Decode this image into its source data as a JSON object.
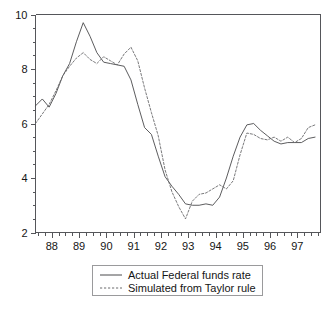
{
  "chart_data": {
    "type": "line",
    "title": "",
    "subtitle": "",
    "xlabel": "",
    "ylabel": "",
    "xlim": [
      1987.4,
      1997.85
    ],
    "ylim": [
      2,
      10
    ],
    "grid": false,
    "legend_position": "below-center",
    "y_ticks": [
      "10",
      "8",
      "6",
      "4",
      "2"
    ],
    "y_tick_values": [
      10,
      8,
      6,
      4,
      2
    ],
    "y_minor_step": 0.5,
    "x_ticks": [
      "88",
      "89",
      "90",
      "91",
      "92",
      "93",
      "94",
      "95",
      "96",
      "97"
    ],
    "x_tick_values": [
      1988,
      1989,
      1990,
      1991,
      1992,
      1993,
      1994,
      1995,
      1996,
      1997
    ],
    "x_minor_step": 0.25,
    "series": [
      {
        "name": "Actual Federal funds rate",
        "style": "solid",
        "color": "#4a4a4c",
        "x": [
          1987.4,
          1987.65,
          1987.9,
          1988.15,
          1988.4,
          1988.65,
          1988.9,
          1989.15,
          1989.4,
          1989.65,
          1989.9,
          1990.15,
          1990.4,
          1990.65,
          1990.9,
          1991.15,
          1991.4,
          1991.65,
          1991.9,
          1992.15,
          1992.4,
          1992.65,
          1992.9,
          1993.15,
          1993.4,
          1993.65,
          1993.9,
          1994.15,
          1994.4,
          1994.65,
          1994.9,
          1995.15,
          1995.4,
          1995.65,
          1995.9,
          1996.15,
          1996.4,
          1996.65,
          1996.9,
          1997.15,
          1997.4,
          1997.65
        ],
        "y": [
          6.65,
          6.9,
          6.6,
          7.1,
          7.75,
          8.2,
          9.0,
          9.7,
          9.2,
          8.6,
          8.25,
          8.2,
          8.15,
          8.1,
          7.6,
          6.7,
          5.85,
          5.6,
          4.8,
          4.05,
          3.7,
          3.4,
          3.05,
          3.0,
          3.0,
          3.05,
          3.0,
          3.3,
          4.0,
          4.8,
          5.5,
          5.95,
          6.0,
          5.75,
          5.55,
          5.35,
          5.25,
          5.3,
          5.3,
          5.3,
          5.45,
          5.5
        ]
      },
      {
        "name": "Simulated from Taylor rule",
        "style": "dotted",
        "color": "#6a6a6c",
        "x": [
          1987.4,
          1987.65,
          1987.9,
          1988.15,
          1988.4,
          1988.65,
          1988.9,
          1989.15,
          1989.4,
          1989.65,
          1989.9,
          1990.15,
          1990.4,
          1990.65,
          1990.9,
          1991.15,
          1991.4,
          1991.65,
          1991.9,
          1992.15,
          1992.4,
          1992.65,
          1992.9,
          1993.15,
          1993.4,
          1993.65,
          1993.9,
          1994.15,
          1994.4,
          1994.65,
          1994.9,
          1995.15,
          1995.4,
          1995.65,
          1995.9,
          1996.15,
          1996.4,
          1996.65,
          1996.9,
          1997.15,
          1997.4,
          1997.65
        ],
        "y": [
          6.0,
          6.35,
          6.7,
          7.2,
          7.75,
          8.1,
          8.4,
          8.6,
          8.35,
          8.2,
          8.45,
          8.3,
          8.15,
          8.55,
          8.8,
          8.3,
          7.3,
          6.4,
          5.55,
          4.3,
          3.5,
          2.95,
          2.5,
          3.15,
          3.4,
          3.45,
          3.6,
          3.75,
          3.6,
          3.9,
          4.85,
          5.65,
          5.6,
          5.45,
          5.4,
          5.5,
          5.35,
          5.5,
          5.3,
          5.45,
          5.85,
          5.95
        ]
      }
    ]
  },
  "legend": {
    "entries": [
      {
        "label": "Actual Federal funds rate",
        "style": "solid"
      },
      {
        "label": "Simulated from Taylor rule",
        "style": "dotted"
      }
    ]
  }
}
